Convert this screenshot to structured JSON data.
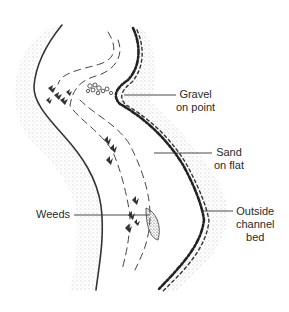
{
  "figure": {
    "type": "stream-channel-diagram",
    "labels": [
      {
        "id": "gravel",
        "lines": [
          "Gravel",
          "on point"
        ]
      },
      {
        "id": "sand",
        "lines": [
          "Sand",
          "on flat"
        ]
      },
      {
        "id": "weeds",
        "lines": [
          "Weeds"
        ]
      },
      {
        "id": "outside",
        "lines": [
          "Outside",
          "channel",
          "bed"
        ]
      }
    ]
  },
  "colors": {
    "ink": "#2a2a2a",
    "stipple": "#555555",
    "background": "#ffffff"
  }
}
